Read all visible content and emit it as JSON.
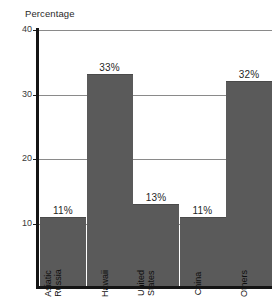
{
  "chart_data": {
    "type": "bar",
    "title": "",
    "ylabel": "Percentage",
    "xlabel": "",
    "categories": [
      "Asiatic Russia",
      "Hawaii",
      "United States",
      "China",
      "Others"
    ],
    "category_lines": [
      [
        "Asiatic",
        "Russia"
      ],
      [
        "Hawaii"
      ],
      [
        "United",
        "States"
      ],
      [
        "China"
      ],
      [
        "Others"
      ]
    ],
    "values": [
      11,
      33,
      13,
      11,
      32
    ],
    "value_labels": [
      "11%",
      "33%",
      "13%",
      "11%",
      "32%"
    ],
    "ylim": [
      0,
      40
    ],
    "yticks": [
      40,
      30,
      20,
      10
    ],
    "ytick_labels": [
      "40",
      "30",
      "20",
      "10"
    ],
    "grid": true,
    "legend": "none",
    "bar_color": "#5a5a5a",
    "axis_color": "#141414",
    "grid_color": "#8a8a8a"
  },
  "axis": {
    "y_title": "Percentage"
  }
}
